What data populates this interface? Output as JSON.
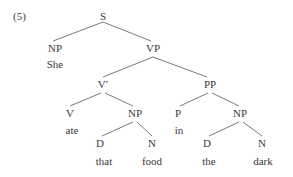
{
  "example_number": "(5)",
  "nodes": {
    "s": {
      "label": "S"
    },
    "np1": {
      "label": "NP",
      "word": "She"
    },
    "vp": {
      "label": "VP"
    },
    "vbar": {
      "label": "V′"
    },
    "pp": {
      "label": "PP"
    },
    "v": {
      "label": "V",
      "word": "ate"
    },
    "np2": {
      "label": "NP"
    },
    "p": {
      "label": "P",
      "word": "in"
    },
    "np3": {
      "label": "NP"
    },
    "d1": {
      "label": "D",
      "word": "that"
    },
    "n1": {
      "label": "N",
      "word": "food"
    },
    "d2": {
      "label": "D",
      "word": "the"
    },
    "n2": {
      "label": "N",
      "word": "dark"
    }
  },
  "edges": [
    [
      "S",
      "NP"
    ],
    [
      "S",
      "VP"
    ],
    [
      "VP",
      "V′"
    ],
    [
      "VP",
      "PP"
    ],
    [
      "V′",
      "V"
    ],
    [
      "V′",
      "NP"
    ],
    [
      "PP",
      "P"
    ],
    [
      "PP",
      "NP"
    ],
    [
      "NP",
      "D (that)"
    ],
    [
      "NP",
      "N (food)"
    ],
    [
      "NP",
      "D (the)"
    ],
    [
      "NP",
      "N (dark)"
    ]
  ],
  "colors": {
    "text": "#3a3a3a",
    "lines": "#7a7a7a",
    "background": "#ffffff"
  }
}
